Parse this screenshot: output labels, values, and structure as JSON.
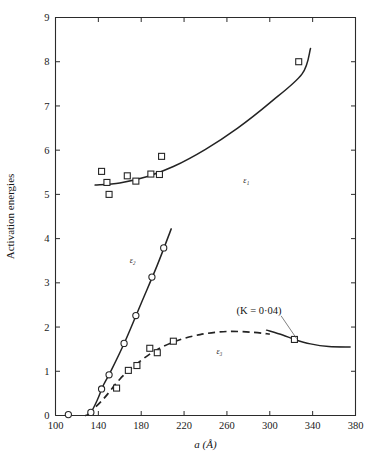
{
  "figure": {
    "background": "#ffffff",
    "ink_color": "#232323"
  },
  "chart_data": {
    "type": "scatter",
    "title": "",
    "subtitle": "",
    "xlabel": "a (Å)",
    "ylabel": "Activation energies",
    "xlim": [
      100,
      380
    ],
    "ylim": [
      0,
      9
    ],
    "xticks": [
      100,
      140,
      180,
      220,
      260,
      300,
      340,
      380
    ],
    "xticklabels": [
      "100",
      "140",
      "180",
      "220",
      "260",
      "300",
      "340",
      "380"
    ],
    "yticks": [
      0,
      1,
      2,
      3,
      4,
      5,
      6,
      7,
      8,
      9
    ],
    "yticklabels": [
      "0",
      "1",
      "2",
      "3",
      "4",
      "5",
      "6",
      "7",
      "8",
      "9"
    ],
    "grid": false,
    "legend_position": "inline-curve-labels",
    "minor_ticks_top": true,
    "minor_ticks_right": true,
    "series": [
      {
        "name": "ε₁",
        "label": "ε₁",
        "label_x": 278,
        "label_y": 5.25,
        "marker": "square",
        "line_style": "solid",
        "points": [
          {
            "x": 143,
            "y": 5.52
          },
          {
            "x": 148,
            "y": 5.27
          },
          {
            "x": 150,
            "y": 5.0
          },
          {
            "x": 167,
            "y": 5.42
          },
          {
            "x": 175,
            "y": 5.3
          },
          {
            "x": 189,
            "y": 5.46
          },
          {
            "x": 197,
            "y": 5.45
          },
          {
            "x": 199,
            "y": 5.86
          },
          {
            "x": 327,
            "y": 8.0
          }
        ],
        "curve": [
          {
            "x": 137,
            "y": 5.21
          },
          {
            "x": 160,
            "y": 5.26
          },
          {
            "x": 185,
            "y": 5.4
          },
          {
            "x": 210,
            "y": 5.63
          },
          {
            "x": 240,
            "y": 6.02
          },
          {
            "x": 270,
            "y": 6.5
          },
          {
            "x": 300,
            "y": 7.07
          },
          {
            "x": 330,
            "y": 7.72
          },
          {
            "x": 338,
            "y": 8.3
          }
        ]
      },
      {
        "name": "ε₂",
        "label": "ε₂",
        "label_x": 172,
        "label_y": 3.45,
        "marker": "circle",
        "line_style": "solid",
        "points": [
          {
            "x": 112,
            "y": 0.02
          },
          {
            "x": 133,
            "y": 0.07
          },
          {
            "x": 143,
            "y": 0.6
          },
          {
            "x": 150,
            "y": 0.92
          },
          {
            "x": 164,
            "y": 1.63
          },
          {
            "x": 175,
            "y": 2.26
          },
          {
            "x": 190,
            "y": 3.13
          },
          {
            "x": 201,
            "y": 3.79
          }
        ],
        "curve": [
          {
            "x": 128,
            "y": 0.0
          },
          {
            "x": 133,
            "y": 0.07
          },
          {
            "x": 139,
            "y": 0.35
          },
          {
            "x": 145,
            "y": 0.7
          },
          {
            "x": 152,
            "y": 1.02
          },
          {
            "x": 165,
            "y": 1.68
          },
          {
            "x": 180,
            "y": 2.54
          },
          {
            "x": 195,
            "y": 3.4
          },
          {
            "x": 208,
            "y": 4.22
          }
        ]
      },
      {
        "name": "ε₃",
        "label": "ε₃",
        "label_x": 253,
        "label_y": 1.38,
        "marker": "square",
        "line_style": "dashed",
        "points": [
          {
            "x": 157,
            "y": 0.62
          },
          {
            "x": 168,
            "y": 1.02
          },
          {
            "x": 176,
            "y": 1.13
          },
          {
            "x": 188,
            "y": 1.52
          },
          {
            "x": 195,
            "y": 1.42
          },
          {
            "x": 210,
            "y": 1.68
          }
        ],
        "curve": [
          {
            "x": 130,
            "y": 0.02
          },
          {
            "x": 145,
            "y": 0.38
          },
          {
            "x": 160,
            "y": 0.82
          },
          {
            "x": 175,
            "y": 1.15
          },
          {
            "x": 192,
            "y": 1.45
          },
          {
            "x": 212,
            "y": 1.68
          },
          {
            "x": 235,
            "y": 1.83
          },
          {
            "x": 260,
            "y": 1.9
          },
          {
            "x": 285,
            "y": 1.88
          },
          {
            "x": 300,
            "y": 1.84
          }
        ]
      },
      {
        "name": "K-branch",
        "label": "",
        "marker": "square",
        "line_style": "solid",
        "points": [
          {
            "x": 323,
            "y": 1.72
          }
        ],
        "curve": [
          {
            "x": 297,
            "y": 1.93
          },
          {
            "x": 312,
            "y": 1.82
          },
          {
            "x": 323,
            "y": 1.72
          },
          {
            "x": 338,
            "y": 1.62
          },
          {
            "x": 355,
            "y": 1.56
          },
          {
            "x": 375,
            "y": 1.55
          }
        ]
      }
    ],
    "annotations": [
      {
        "text": "(K = 0·04)",
        "x": 290,
        "y": 2.3,
        "leader_to_x": 325,
        "leader_to_y": 1.74
      }
    ]
  }
}
